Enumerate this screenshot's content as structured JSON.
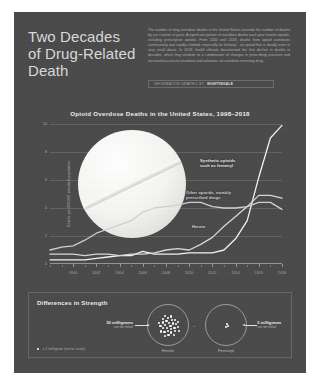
{
  "poster": {
    "background_color": "#4a4a4a",
    "headline": "Two Decades\nof Drug-Related\nDeath",
    "standfirst": "The number of drug overdose deaths in the United States exceeds the number of deaths by car crashes or guns. A significant portion of overdose deaths each year involve opioids, including prescription opioids. From 2000 until 2018, deaths from opioid overdoses continuously and rapidly climbed, especially for fentanyl - an opioid that is deadly even in very small doses. In 2018, health officials documented the first decline in deaths in decades, which they attribute to a combination of changes in prescribing practices and increased access to treatment and naloxone, an overdose reversing drug.",
    "byline_prefix": "Information graphic by",
    "byline_author": "Nightingale"
  },
  "chart_data": {
    "type": "line",
    "title": "Opioid Overdose Deaths in the United States, 1998–2018",
    "xlabel": "",
    "ylabel": "Deaths per 100,000 standard population",
    "xlim": [
      1998,
      2018
    ],
    "ylim": [
      0,
      10
    ],
    "grid": true,
    "legend_position": "inline-annotations",
    "x_ticks": [
      2000,
      2002,
      2004,
      2006,
      2008,
      2010,
      2012,
      2014,
      2016,
      2018
    ],
    "x_tick_labels": [
      "2000",
      "2002",
      "2004",
      "2006",
      "2008",
      "2010",
      "2012",
      "2014",
      "2016",
      "2018"
    ],
    "y_ticks": [
      0,
      2,
      4,
      6,
      8,
      10
    ],
    "y_tick_labels": [
      "0",
      "2",
      "4",
      "6",
      "8",
      "10"
    ],
    "x": [
      1998,
      1999,
      2000,
      2001,
      2002,
      2003,
      2004,
      2005,
      2006,
      2007,
      2008,
      2009,
      2010,
      2011,
      2012,
      2013,
      2014,
      2015,
      2016,
      2017,
      2018
    ],
    "series": [
      {
        "name": "Synthetic opioids such as fentanyl",
        "label": "Synthetic opioids\nsuch as fentanyl",
        "color": "#f2f2f2",
        "values": [
          0.3,
          0.3,
          0.3,
          0.3,
          0.4,
          0.5,
          0.6,
          0.6,
          0.9,
          0.7,
          0.7,
          0.7,
          0.8,
          0.8,
          0.8,
          1.0,
          1.8,
          3.1,
          6.2,
          9.0,
          9.9
        ]
      },
      {
        "name": "Other opioids, notably prescribed drugs",
        "label": "Other opioids, notably\nprescribed drugs",
        "color": "#cfcfcf",
        "values": [
          1.0,
          1.2,
          1.3,
          1.7,
          2.2,
          2.5,
          2.8,
          3.1,
          3.7,
          4.0,
          4.1,
          4.2,
          4.4,
          4.4,
          4.1,
          4.0,
          4.0,
          4.1,
          4.4,
          4.4,
          3.9
        ]
      },
      {
        "name": "Heroin",
        "label": "Heroin",
        "color": "#d8d8d8",
        "values": [
          0.7,
          0.7,
          0.7,
          0.6,
          0.7,
          0.7,
          0.6,
          0.7,
          0.7,
          0.8,
          1.0,
          1.1,
          1.0,
          1.4,
          1.9,
          2.7,
          3.4,
          4.1,
          4.9,
          4.9,
          4.7
        ]
      }
    ]
  },
  "strength": {
    "title": "Differences in Strength",
    "heroin": {
      "caption": "Heroin",
      "amount": "30 milligrams",
      "sub": "can be lethal",
      "dot_count": 30
    },
    "fentanyl": {
      "caption": "Fentanyl",
      "amount": "3 milligrams",
      "sub": "can be lethal",
      "dot_count": 3
    },
    "arrow_glyph": "→",
    "legend_text": "= 1 milligram (not to scale)"
  }
}
